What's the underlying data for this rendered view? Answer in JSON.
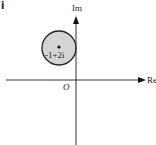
{
  "figure": {
    "corner_label": "i",
    "axes": {
      "x_label": "Re",
      "y_label": "Im",
      "origin_label": "O"
    },
    "circle": {
      "center_label": "-1+2i",
      "fill_color": "#d4d4d4",
      "stroke_color": "#222222"
    }
  }
}
